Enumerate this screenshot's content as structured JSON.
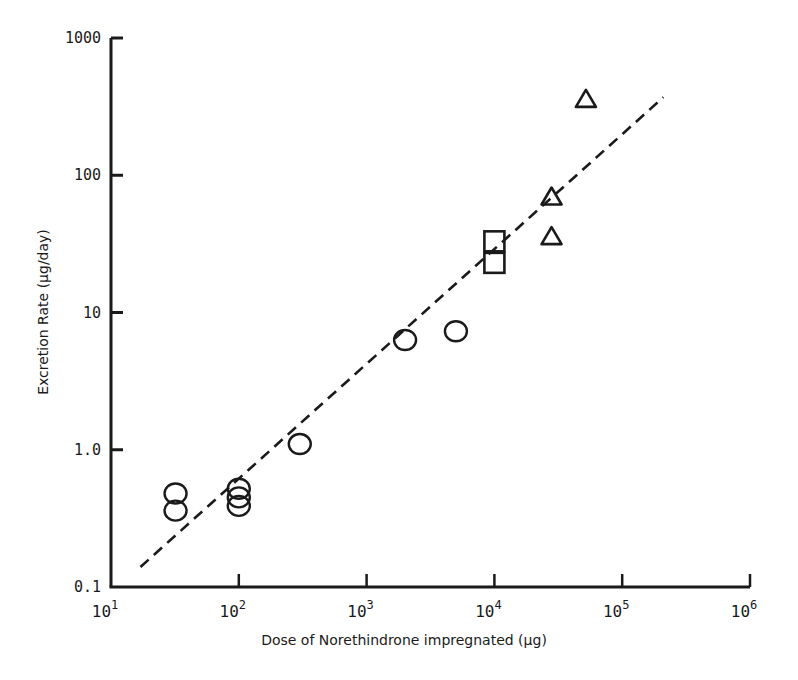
{
  "chart_data": {
    "type": "scatter",
    "title": "",
    "xlabel": "Dose of Norethindrone impregnated (µg)",
    "ylabel": "Excretion Rate (µg/day)",
    "xscale": "log",
    "yscale": "log",
    "xlim": [
      10,
      1000000
    ],
    "ylim": [
      0.1,
      1000
    ],
    "x_ticks": [
      {
        "base": "10",
        "exp": "1",
        "value": 10
      },
      {
        "base": "10",
        "exp": "2",
        "value": 100
      },
      {
        "base": "10",
        "exp": "3",
        "value": 1000
      },
      {
        "base": "10",
        "exp": "4",
        "value": 10000
      },
      {
        "base": "10",
        "exp": "5",
        "value": 100000
      },
      {
        "base": "10",
        "exp": "6",
        "value": 1000000
      }
    ],
    "y_ticks": [
      {
        "label": "1000",
        "value": 1000
      },
      {
        "label": "100",
        "value": 100
      },
      {
        "label": "10",
        "value": 10
      },
      {
        "label": "1.0",
        "value": 1
      },
      {
        "label": "0.1",
        "value": 0.1
      }
    ],
    "grid": false,
    "legend": null,
    "series": [
      {
        "name": "circles",
        "marker": "circle",
        "points": [
          {
            "x": 32,
            "y": 0.48
          },
          {
            "x": 32,
            "y": 0.36
          },
          {
            "x": 100,
            "y": 0.52
          },
          {
            "x": 100,
            "y": 0.45
          },
          {
            "x": 100,
            "y": 0.39
          },
          {
            "x": 300,
            "y": 1.1
          },
          {
            "x": 2000,
            "y": 6.3
          },
          {
            "x": 5000,
            "y": 7.3
          }
        ]
      },
      {
        "name": "squares",
        "marker": "square",
        "points": [
          {
            "x": 10000,
            "y": 33
          },
          {
            "x": 10000,
            "y": 23
          }
        ]
      },
      {
        "name": "triangles",
        "marker": "triangle",
        "points": [
          {
            "x": 28000,
            "y": 70
          },
          {
            "x": 28000,
            "y": 36
          },
          {
            "x": 52000,
            "y": 360
          }
        ]
      }
    ],
    "fit_line": {
      "style": "dashed",
      "from": {
        "x": 17,
        "y": 0.14
      },
      "to": {
        "x": 210000,
        "y": 370
      }
    }
  },
  "layout": {
    "plot": {
      "left": 111,
      "right": 750,
      "top": 38,
      "bottom": 587
    },
    "colors": {
      "ink": "#1a1a1a",
      "background": "#ffffff"
    }
  }
}
